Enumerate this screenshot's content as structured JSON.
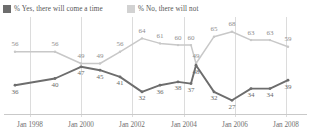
{
  "legend": {
    "series": [
      {
        "key": "yes",
        "label": "% Yes, there  will come a time",
        "swatch": "dark-square-icon",
        "color": "#6d6d6d"
      },
      {
        "key": "no",
        "label": "% No, there will not",
        "swatch": "light-square-icon",
        "color": "#d2d2d2"
      }
    ]
  },
  "chart_data": {
    "type": "line",
    "title": "",
    "xlabel": "",
    "ylabel": "",
    "grid": true,
    "legend_position": "top-left",
    "ylim": [
      20,
      72
    ],
    "x_tick_labels": [
      "Jan 1998",
      "Jan 2000",
      "Jan 2002",
      "Jan 2004",
      "Jan 2006",
      "Jan 2008"
    ],
    "x_tick_positions": [
      30,
      81,
      132,
      184,
      235,
      286
    ],
    "x": [
      15,
      55,
      81,
      100,
      120,
      142,
      160,
      178,
      191,
      196,
      214,
      232,
      251,
      270,
      288
    ],
    "series": [
      {
        "name": "% No, there will not",
        "color": "#c8c8c8",
        "values": [
          56,
          56,
          49,
          49,
          56,
          64,
          61,
          60,
          60,
          49,
          65,
          68,
          63,
          63,
          59
        ]
      },
      {
        "name": "% Yes, there  will come a time",
        "color": "#6d6d6d",
        "values": [
          36,
          40,
          47,
          45,
          41,
          32,
          36,
          38,
          37,
          48,
          32,
          27,
          34,
          34,
          39
        ]
      }
    ]
  }
}
